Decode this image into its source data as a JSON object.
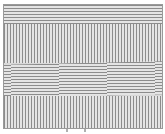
{
  "figure": {
    "bands": [
      {
        "orientation": "horizontal"
      },
      {
        "orientation": "vertical"
      },
      {
        "orientation": "horizontal"
      },
      {
        "orientation": "vertical"
      }
    ],
    "line_color": "#8c8c8c",
    "background_color": "#e4e4e4",
    "bottom_marks": [
      "a",
      "b"
    ]
  }
}
